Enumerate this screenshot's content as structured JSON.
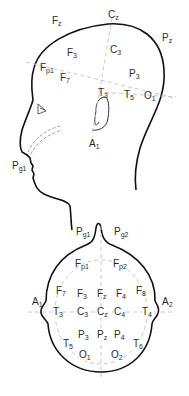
{
  "side_view": {
    "title": "Lateral view",
    "electrodes": [
      {
        "id": "Fz",
        "base": "F",
        "sub": "z",
        "x": 52,
        "y": 16
      },
      {
        "id": "Cz",
        "base": "C",
        "sub": "z",
        "x": 108,
        "y": 10
      },
      {
        "id": "Pz",
        "base": "P",
        "sub": "z",
        "x": 162,
        "y": 33
      },
      {
        "id": "F3",
        "base": "F",
        "sub": "3",
        "x": 67,
        "y": 48
      },
      {
        "id": "C3",
        "base": "C",
        "sub": "3",
        "x": 110,
        "y": 45
      },
      {
        "id": "Fp1",
        "base": "F",
        "sub": "p1",
        "x": 40,
        "y": 63
      },
      {
        "id": "F7",
        "base": "F",
        "sub": "7",
        "x": 60,
        "y": 73
      },
      {
        "id": "P3",
        "base": "P",
        "sub": "3",
        "x": 129,
        "y": 69
      },
      {
        "id": "T3",
        "base": "T",
        "sub": "3",
        "x": 98,
        "y": 88
      },
      {
        "id": "T5",
        "base": "T",
        "sub": "5",
        "x": 124,
        "y": 90
      },
      {
        "id": "O1",
        "base": "O",
        "sub": "1",
        "x": 144,
        "y": 91
      },
      {
        "id": "Pg1",
        "base": "P",
        "sub": "g1",
        "x": 12,
        "y": 161
      },
      {
        "id": "A1",
        "base": "A",
        "sub": "1",
        "x": 89,
        "y": 139
      }
    ]
  },
  "top_view": {
    "title": "Superior view",
    "electrodes": [
      {
        "id": "Pg1",
        "base": "P",
        "sub": "g1",
        "x": 76,
        "y": 227
      },
      {
        "id": "Pg2",
        "base": "P",
        "sub": "g2",
        "x": 114,
        "y": 227
      },
      {
        "id": "Fp1",
        "base": "F",
        "sub": "p1",
        "x": 75,
        "y": 259
      },
      {
        "id": "Fp2",
        "base": "F",
        "sub": "p2",
        "x": 113,
        "y": 259
      },
      {
        "id": "F7",
        "base": "F",
        "sub": "7",
        "x": 56,
        "y": 286
      },
      {
        "id": "F3",
        "base": "F",
        "sub": "3",
        "x": 77,
        "y": 289
      },
      {
        "id": "Fz",
        "base": "F",
        "sub": "z",
        "x": 97,
        "y": 289
      },
      {
        "id": "F4",
        "base": "F",
        "sub": "4",
        "x": 116,
        "y": 289
      },
      {
        "id": "F8",
        "base": "F",
        "sub": "8",
        "x": 136,
        "y": 286
      },
      {
        "id": "A1",
        "base": "A",
        "sub": "1",
        "x": 32,
        "y": 297
      },
      {
        "id": "A2",
        "base": "A",
        "sub": "2",
        "x": 162,
        "y": 297
      },
      {
        "id": "T3",
        "base": "T",
        "sub": "3",
        "x": 53,
        "y": 307
      },
      {
        "id": "C3",
        "base": "C",
        "sub": "3",
        "x": 77,
        "y": 307
      },
      {
        "id": "Cz",
        "base": "C",
        "sub": "z",
        "x": 97,
        "y": 307
      },
      {
        "id": "C4",
        "base": "C",
        "sub": "4",
        "x": 114,
        "y": 307
      },
      {
        "id": "T4",
        "base": "T",
        "sub": "4",
        "x": 142,
        "y": 307
      },
      {
        "id": "P3",
        "base": "P",
        "sub": "3",
        "x": 78,
        "y": 330
      },
      {
        "id": "Pz",
        "base": "P",
        "sub": "z",
        "x": 97,
        "y": 330
      },
      {
        "id": "P4",
        "base": "P",
        "sub": "4",
        "x": 114,
        "y": 330
      },
      {
        "id": "T5",
        "base": "T",
        "sub": "5",
        "x": 63,
        "y": 339
      },
      {
        "id": "T6",
        "base": "T",
        "sub": "6",
        "x": 133,
        "y": 339
      },
      {
        "id": "O1",
        "base": "O",
        "sub": "1",
        "x": 79,
        "y": 350
      },
      {
        "id": "O2",
        "base": "O",
        "sub": "2",
        "x": 111,
        "y": 350
      }
    ]
  },
  "colors": {
    "outline": "#111111",
    "guide": "#c8c8c8",
    "label": "#2a2a2a"
  }
}
